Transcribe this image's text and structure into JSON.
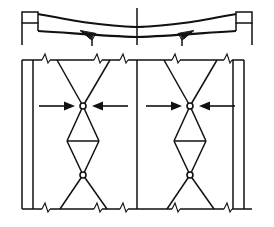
{
  "figure": {
    "title_strip": "",
    "background_color": "#ffffff",
    "line_color": "#111111",
    "width": 274,
    "height": 227,
    "views": [
      {
        "name": "girder-elevation-profile",
        "label": "",
        "region": "top"
      },
      {
        "name": "braced-frame-elevation",
        "label": "",
        "region": "bottom"
      }
    ]
  },
  "top_view": {
    "name": "haunched-girder-elevation",
    "description": "Two-span haunched girder profile with stepped end blocks and a central pier",
    "left_end_block": {
      "x": 22,
      "y": 12,
      "width": 16,
      "height": 11
    },
    "right_end_block": {
      "x": 236,
      "y": 12,
      "width": 16,
      "height": 11
    },
    "pier_x": 137,
    "soffit_y": 40,
    "deck_y": 22,
    "midspan_dip_y": 30,
    "haunch_count": 2
  },
  "bottom_view": {
    "name": "x-braced-frame-elevation",
    "top_beam_y": 60,
    "bottom_beam_y": 209,
    "left_column_x": [
      22,
      33
    ],
    "right_column_x": [
      233,
      244
    ],
    "center_column_x": 137,
    "bays": [
      {
        "name": "bay-left",
        "center_x": 83,
        "left_x": 57,
        "right_x": 110,
        "upper_node": {
          "cx": 83,
          "cy": 106,
          "r": 3.0
        },
        "lower_node": {
          "cx": 83,
          "cy": 175,
          "r": 3.0
        },
        "diamond_mid_y": 141,
        "diamond_half_width": 16,
        "arrows": [
          {
            "name": "compression-arrow-left",
            "direction": "right",
            "from_x": 39,
            "to_x": 73,
            "y": 106
          },
          {
            "name": "compression-arrow-right",
            "direction": "left",
            "from_x": 128,
            "to_x": 94,
            "y": 106
          }
        ]
      },
      {
        "name": "bay-right",
        "center_x": 190,
        "left_x": 164,
        "right_x": 217,
        "upper_node": {
          "cx": 190,
          "cy": 106,
          "r": 3.0
        },
        "lower_node": {
          "cx": 190,
          "cy": 175,
          "r": 3.0
        },
        "diamond_mid_y": 141,
        "diamond_half_width": 16,
        "arrows": [
          {
            "name": "compression-arrow-left",
            "direction": "right",
            "from_x": 146,
            "to_x": 180,
            "y": 106
          },
          {
            "name": "compression-arrow-right",
            "direction": "left",
            "from_x": 235,
            "to_x": 201,
            "y": 106
          }
        ]
      }
    ],
    "break_symbols_top": [
      46,
      98,
      124,
      176,
      228
    ],
    "break_symbols_bottom": [
      46,
      98,
      124,
      176,
      228
    ],
    "break_symbol_name": "break-line-zigzag"
  },
  "annotations": {
    "node_label": "pin-connection-node",
    "arrow_label": "applied-load-arrow",
    "column_label": "vertical-column",
    "brace_label": "diagonal-brace-member"
  }
}
